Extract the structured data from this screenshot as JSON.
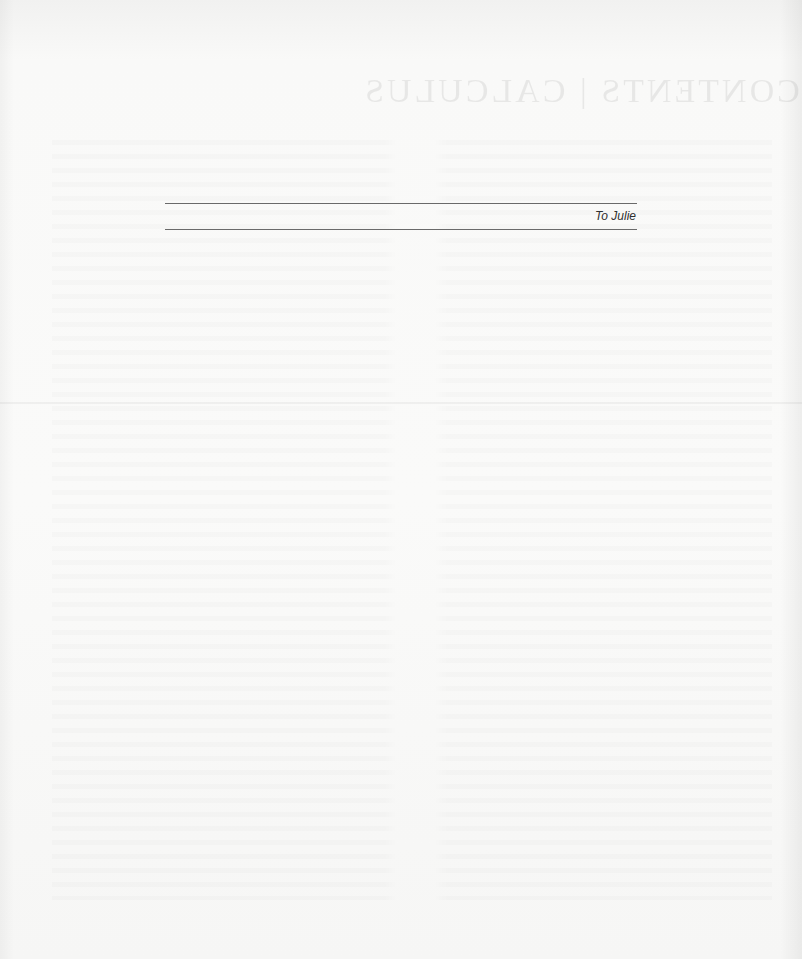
{
  "page": {
    "type": "dedication",
    "background_color": "#f7f7f6",
    "rule_color": "#6a6a6a",
    "text_color": "#2f2f2f"
  },
  "dedication": {
    "text": "To Julie"
  },
  "bleed_through": {
    "heading": "CONTENTS | CALCULUS",
    "mirrored": true
  }
}
